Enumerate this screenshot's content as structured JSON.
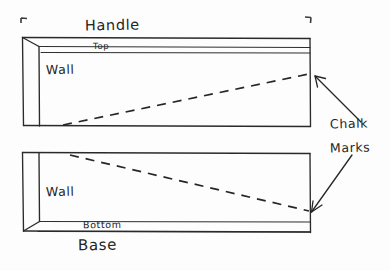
{
  "diagram": {
    "title_visible": false,
    "background_color": "#fdfdfd",
    "ink_color": "#2a2a2a",
    "labels": {
      "handle": "Handle",
      "top": "Top",
      "wall_upper": "Wall",
      "wall_lower": "Wall",
      "bottom": "Bottom",
      "base": "Base",
      "chalk": "Chalk",
      "marks": "Marks"
    },
    "annotations": {
      "chalk_marks_full": "Chalk Marks",
      "arrow_count": 2,
      "arrow_upper_target": "right edge of upper box where dashed line ends",
      "arrow_lower_target": "right edge of lower box where dashed line ends"
    },
    "shapes": {
      "upper_box": {
        "name": "Handle",
        "face_label": "Wall",
        "edge_label": "Top",
        "dashed_line_direction": "rises left-to-right"
      },
      "lower_box": {
        "name": "Base",
        "face_label": "Wall",
        "edge_label": "Bottom",
        "dashed_line_direction": "falls left-to-right"
      }
    },
    "corner_marks": {
      "top_left": "crop-corner-bracket",
      "top_right": "crop-corner-bracket"
    }
  }
}
